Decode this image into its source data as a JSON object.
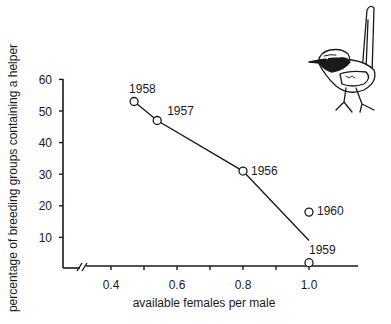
{
  "chart_data": {
    "type": "line",
    "title": "",
    "xlabel": "available females per male",
    "ylabel": "percentage of breeding groups containing a helper",
    "xlim": [
      0.3,
      1.15
    ],
    "ylim": [
      0,
      60
    ],
    "x_axis_break": true,
    "grid": false,
    "legend": null,
    "x_ticks": [
      0.4,
      0.5,
      0.6,
      0.7,
      0.8,
      0.9,
      1.0
    ],
    "x_tick_labels": [
      {
        "value": 0.4,
        "label": "0.4"
      },
      {
        "value": 0.6,
        "label": "0.6"
      },
      {
        "value": 0.8,
        "label": "0.8"
      },
      {
        "value": 1.0,
        "label": "1.0"
      }
    ],
    "y_ticks": [
      {
        "value": 10,
        "label": "10"
      },
      {
        "value": 20,
        "label": "20"
      },
      {
        "value": 30,
        "label": "30"
      },
      {
        "value": 40,
        "label": "40"
      },
      {
        "value": 50,
        "label": "50"
      },
      {
        "value": 60,
        "label": "60"
      }
    ],
    "points": [
      {
        "label": "1958",
        "x": 0.47,
        "y": 53
      },
      {
        "label": "1957",
        "x": 0.54,
        "y": 47
      },
      {
        "label": "1956",
        "x": 0.8,
        "y": 31
      },
      {
        "label": "1960",
        "x": 1.0,
        "y": 18
      },
      {
        "label": "1959",
        "x": 1.0,
        "y": 2
      }
    ],
    "trend_line": [
      {
        "x": 0.47,
        "y": 53
      },
      {
        "x": 0.54,
        "y": 47
      },
      {
        "x": 0.8,
        "y": 31
      },
      {
        "x": 1.0,
        "y": 9
      }
    ],
    "annotations": [
      "illustration of a fairy-wren bird (top right)"
    ]
  },
  "colors": {
    "ink": "#1a1a1a",
    "background": "#ffffff"
  },
  "illustration": {
    "name": "fairy-wren bird drawing"
  }
}
